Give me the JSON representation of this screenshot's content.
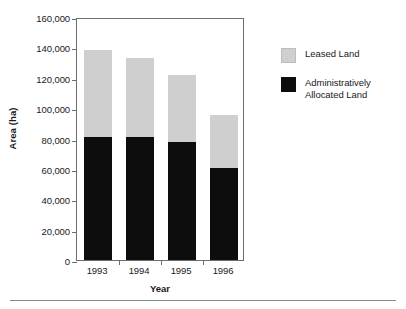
{
  "chart_data": {
    "type": "bar",
    "subtype": "stacked-vertical",
    "title": "",
    "xlabel": "Year",
    "ylabel": "Area (ha)",
    "categories": [
      "1993",
      "1994",
      "1995",
      "1996"
    ],
    "series": [
      {
        "name": "Administratively Allocated Land",
        "color": "#0d0d0d",
        "values": [
          81000,
          81000,
          78000,
          60500
        ]
      },
      {
        "name": "Leased Land",
        "color": "#cfcfcf",
        "values": [
          57500,
          52000,
          44000,
          35000
        ]
      }
    ],
    "totals": [
      138500,
      133000,
      122000,
      95500
    ],
    "ylim": [
      0,
      160000
    ],
    "ytick_step": 20000,
    "ytick_labels": [
      "160,000",
      "140,000",
      "120,000",
      "100,000",
      "80,000",
      "60,000",
      "40,000",
      "20,000",
      "0"
    ],
    "ytick_values": [
      160000,
      140000,
      120000,
      100000,
      80000,
      60000,
      40000,
      20000,
      0
    ],
    "grid": false,
    "legend_position": "right",
    "legend": [
      {
        "label": "Leased Land",
        "color": "#cfcfcf"
      },
      {
        "label": "Administratively Allocated Land",
        "color": "#0d0d0d"
      }
    ]
  },
  "legend": {
    "leased_label": "Leased Land",
    "allocated_label_line1": "Administratively",
    "allocated_label_line2": "Allocated Land"
  },
  "axes": {
    "y_title": "Area (ha)",
    "x_title": "Year"
  }
}
